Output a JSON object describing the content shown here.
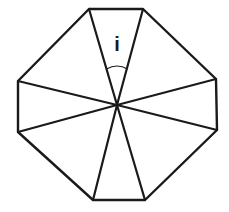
{
  "diagram": {
    "type": "octagon-divided-into-triangles",
    "stroke_color": "#1a1a1a",
    "background": "#ffffff",
    "center": [
      117,
      105
    ],
    "vertices": [
      [
        89,
        9
      ],
      [
        143,
        9
      ],
      [
        216,
        79
      ],
      [
        217,
        130
      ],
      [
        145,
        200
      ],
      [
        93,
        200
      ],
      [
        18,
        132
      ],
      [
        18,
        81
      ]
    ],
    "angle_label": {
      "text": "i",
      "position": [
        117,
        50
      ]
    }
  }
}
